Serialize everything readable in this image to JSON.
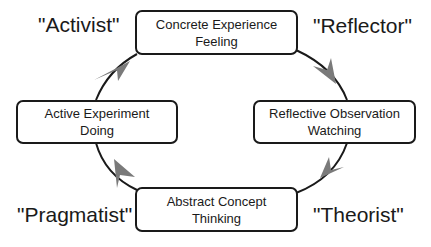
{
  "diagram": {
    "type": "cycle",
    "colors": {
      "stroke": "#1a1a1a",
      "arrow": "#7a7a7a",
      "background": "#ffffff"
    },
    "stages": [
      {
        "id": "concrete-experience",
        "title": "Concrete Experience",
        "subtitle": "Feeling"
      },
      {
        "id": "reflective-observation",
        "title": "Reflective Observation",
        "subtitle": "Watching"
      },
      {
        "id": "abstract-concept",
        "title": "Abstract Concept",
        "subtitle": "Thinking"
      },
      {
        "id": "active-experiment",
        "title": "Active Experiment",
        "subtitle": "Doing"
      }
    ],
    "learner_styles": [
      {
        "label": "\"Activist\""
      },
      {
        "label": "\"Reflector\""
      },
      {
        "label": "\"Theorist\""
      },
      {
        "label": "\"Pragmatist\""
      }
    ],
    "flow": [
      {
        "from": "concrete-experience",
        "to": "reflective-observation"
      },
      {
        "from": "reflective-observation",
        "to": "abstract-concept"
      },
      {
        "from": "abstract-concept",
        "to": "active-experiment"
      },
      {
        "from": "active-experiment",
        "to": "concrete-experience"
      }
    ]
  }
}
